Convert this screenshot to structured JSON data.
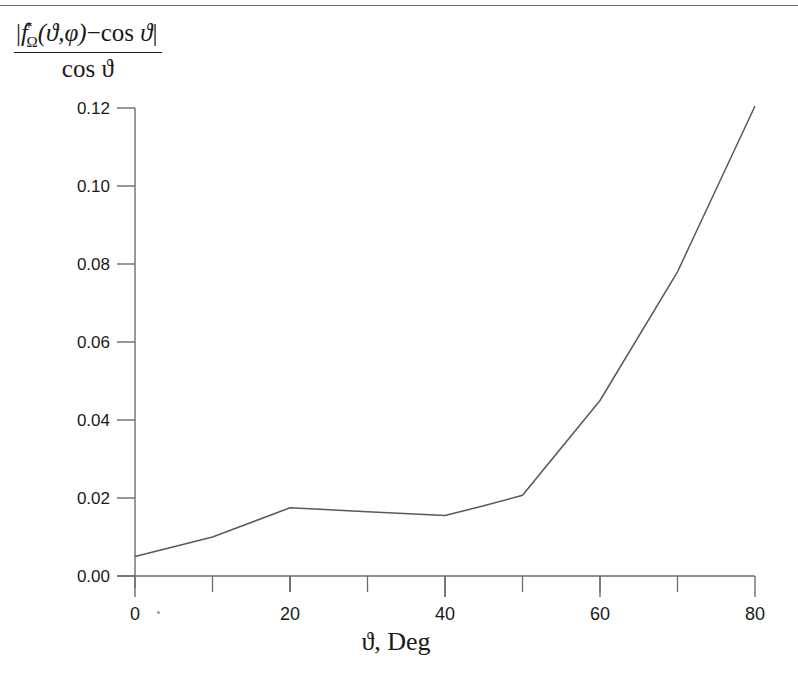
{
  "figure": {
    "background_color": "#ffffff",
    "line_color": "#59595c",
    "axis_color": "#6b6b6b",
    "text_color": "#1a1a1a",
    "top_rule": true
  },
  "ylabel": {
    "numerator_parts": {
      "bar_open": "|",
      "f": "f",
      "star": "*",
      "omega": "Ω",
      "args": "(ϑ,φ)",
      "minus": "−",
      "cos": "cos",
      "theta": "ϑ",
      "bar_close": "|"
    },
    "denominator": "cos ϑ",
    "plain_text": "| f*_Ω(ϑ,φ) − cos ϑ | / cos ϑ"
  },
  "xlabel": "ϑ, Deg",
  "chart_data": {
    "type": "line",
    "title": "",
    "subtitle": "",
    "xlabel": "ϑ, Deg",
    "ylabel": "| f*_Ω(ϑ,φ) − cos ϑ | / cos ϑ",
    "x": [
      0,
      10,
      20,
      30,
      40,
      45,
      50,
      60,
      70,
      80
    ],
    "y": [
      0.005,
      0.01,
      0.0175,
      0.0165,
      0.0155,
      0.018,
      0.0207,
      0.045,
      0.078,
      0.1205
    ],
    "series": [
      {
        "name": "relative error",
        "x": [
          0,
          10,
          20,
          30,
          40,
          45,
          50,
          60,
          70,
          80
        ],
        "values": [
          0.005,
          0.01,
          0.0175,
          0.0165,
          0.0155,
          0.018,
          0.0207,
          0.045,
          0.078,
          0.1205
        ]
      }
    ],
    "xlim": [
      0,
      80
    ],
    "ylim": [
      0.0,
      0.12
    ],
    "xticks": [
      0,
      20,
      40,
      60,
      80
    ],
    "xtick_labels": [
      "0",
      "20",
      "40",
      "60",
      "80"
    ],
    "xminor_ticks": [
      10,
      30,
      50,
      70
    ],
    "yticks": [
      0.0,
      0.02,
      0.04,
      0.06,
      0.08,
      0.1,
      0.12
    ],
    "ytick_labels": [
      "0.00",
      "0.02",
      "0.04",
      "0.06",
      "0.08",
      "0.10",
      "0.12"
    ],
    "grid": false,
    "legend": null,
    "legend_position": "none",
    "marker": "none",
    "line_style": "solid"
  }
}
